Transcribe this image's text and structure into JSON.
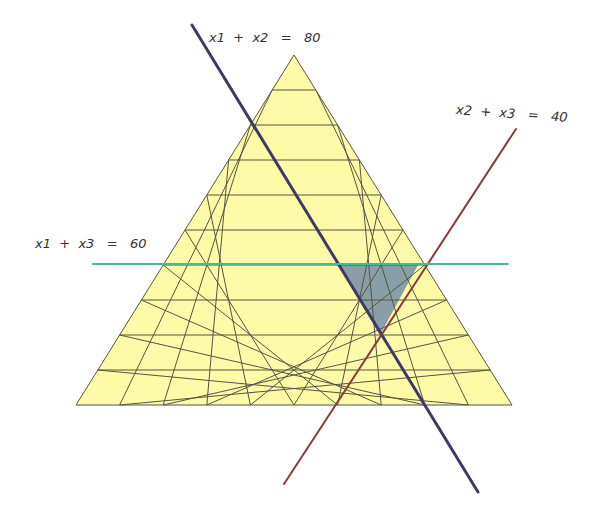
{
  "labels": {
    "line_x1_x2": "x1  +  x2   =   80",
    "line_x2_x3": "x2  +  x3   =   40",
    "line_x1_x3": "x1  +  x3   =   60"
  },
  "triangle": {
    "apex": [
      294,
      55
    ],
    "base_left": [
      76,
      405
    ],
    "base_right": [
      512,
      405
    ],
    "divisions": 10,
    "fill": "#fdfaa8",
    "grid_color": "#555544"
  },
  "lines": [
    {
      "name": "x1+x2=80",
      "color": "#3d3a66",
      "from": [
        192,
        25
      ],
      "to": [
        478,
        492
      ]
    },
    {
      "name": "x2+x3=40",
      "color": "#8a3a3a",
      "from": [
        284,
        484
      ],
      "to": [
        516,
        129
      ]
    },
    {
      "name": "x1+x3=60",
      "color": "#3fbf8f",
      "from": [
        93,
        264
      ],
      "to": [
        508,
        264
      ]
    }
  ],
  "feasible_region": {
    "fill": "#8a9ea8",
    "points": [
      [
        338,
        265
      ],
      [
        418,
        265
      ],
      [
        380,
        335
      ]
    ]
  }
}
